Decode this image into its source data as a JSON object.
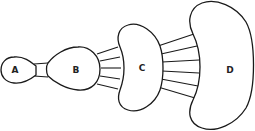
{
  "diagram": {
    "nodes": [
      {
        "id": "A",
        "label": "A"
      },
      {
        "id": "B",
        "label": "B"
      },
      {
        "id": "C",
        "label": "C"
      },
      {
        "id": "D",
        "label": "D"
      }
    ],
    "connections": [
      {
        "from": "A",
        "to": "B",
        "line_count": 2
      },
      {
        "from": "B",
        "to": "C",
        "line_count": 5
      },
      {
        "from": "C",
        "to": "D",
        "line_count": 6
      }
    ],
    "colors": {
      "stroke": "#1a1a1a",
      "fill": "#ffffff",
      "background": "#ffffff"
    }
  }
}
